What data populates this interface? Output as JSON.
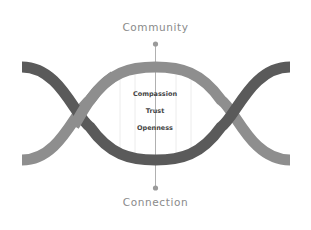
{
  "diagram": {
    "top_label": "Community",
    "bottom_label": "Connection",
    "center_items": [
      "Compassion",
      "Trust",
      "Openness"
    ],
    "colors": {
      "dark_wave": "#5a5a5a",
      "light_wave": "#8e8e8e",
      "label_text": "#8a8a8a",
      "center_text": "#444444",
      "axis_line": "#9a9a9a",
      "guide_lines": "#e6e6e6"
    }
  }
}
